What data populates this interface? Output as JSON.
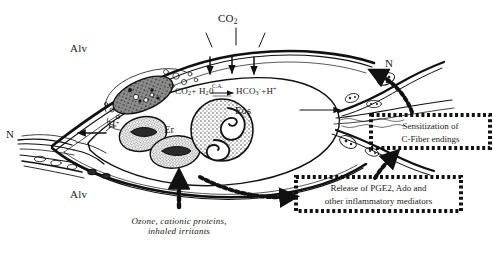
{
  "figure": {
    "background_color": "#ffffff",
    "ink_color": "#1a1a1a"
  },
  "labels": {
    "alveolus_top": "Alv",
    "alveolus_bottom": "Alv",
    "nerve_left": "N",
    "nerve_right": "N",
    "co2_gas": "CO",
    "co2_gas_sub": "2",
    "erythrocyte": "Er",
    "eosinophil": "Eos",
    "proton": "H",
    "proton_sup": "+"
  },
  "equation": {
    "reactant_1": "CO",
    "reactant_1_sub": "2",
    "plus_1": "+",
    "reactant_2": "H",
    "reactant_2_sub": "2",
    "reactant_2_tail": "0",
    "catalyst": "C.A.",
    "product_1": "HCO",
    "product_1_sub": "3",
    "product_1_sup": "-",
    "plus_2": "+",
    "product_2": "H",
    "product_2_sup": "+",
    "full_text": "CO2 + H20 --C.A.--> HCO3- + H+"
  },
  "boxes": [
    {
      "id": "sensitization",
      "line_1": "Sensitization of",
      "line_2": "C-Fiber endings",
      "border_style": "dotted"
    },
    {
      "id": "mediators",
      "line_1": "Release of PGE2, Ado and",
      "line_2": "other inflammatory mediators",
      "border_style": "dotted"
    }
  ],
  "caption": {
    "line_1": "Ozone, cationic proteins,",
    "line_2": "inhaled irritants"
  }
}
